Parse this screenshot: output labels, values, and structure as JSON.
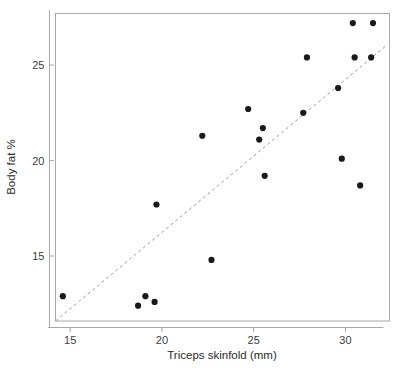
{
  "chart_data": {
    "type": "scatter",
    "title": "",
    "xlabel": "Triceps skinfold (mm)",
    "ylabel": "Body fat %",
    "xlim": [
      14.2,
      32.4
    ],
    "ylim": [
      11.6,
      27.7
    ],
    "xticks": [
      15,
      20,
      25,
      30
    ],
    "yticks": [
      15,
      20,
      25
    ],
    "xticklabels": [
      "15",
      "20",
      "25",
      "30"
    ],
    "yticklabels": [
      "15",
      "20",
      "25"
    ],
    "grid": false,
    "legend": null,
    "marker": "filled-circle",
    "marker_color": "#1a1a1a",
    "points": [
      {
        "x": 14.6,
        "y": 12.9
      },
      {
        "x": 18.7,
        "y": 12.4
      },
      {
        "x": 19.1,
        "y": 12.9
      },
      {
        "x": 19.6,
        "y": 12.6
      },
      {
        "x": 19.7,
        "y": 17.7
      },
      {
        "x": 22.2,
        "y": 21.3
      },
      {
        "x": 22.7,
        "y": 14.8
      },
      {
        "x": 24.7,
        "y": 22.7
      },
      {
        "x": 25.3,
        "y": 21.1
      },
      {
        "x": 25.5,
        "y": 21.7
      },
      {
        "x": 25.6,
        "y": 19.2
      },
      {
        "x": 27.7,
        "y": 22.5
      },
      {
        "x": 27.9,
        "y": 25.4
      },
      {
        "x": 29.6,
        "y": 23.8
      },
      {
        "x": 29.8,
        "y": 20.1
      },
      {
        "x": 30.4,
        "y": 27.2
      },
      {
        "x": 30.5,
        "y": 25.4
      },
      {
        "x": 30.8,
        "y": 18.7
      },
      {
        "x": 31.4,
        "y": 25.4
      },
      {
        "x": 31.5,
        "y": 27.2
      }
    ],
    "fit_line": {
      "style": "dashed",
      "color": "#9b9b9b",
      "x_start": 14.2,
      "y_start": 11.6,
      "x_end": 32.2,
      "y_end": 26.0
    }
  }
}
